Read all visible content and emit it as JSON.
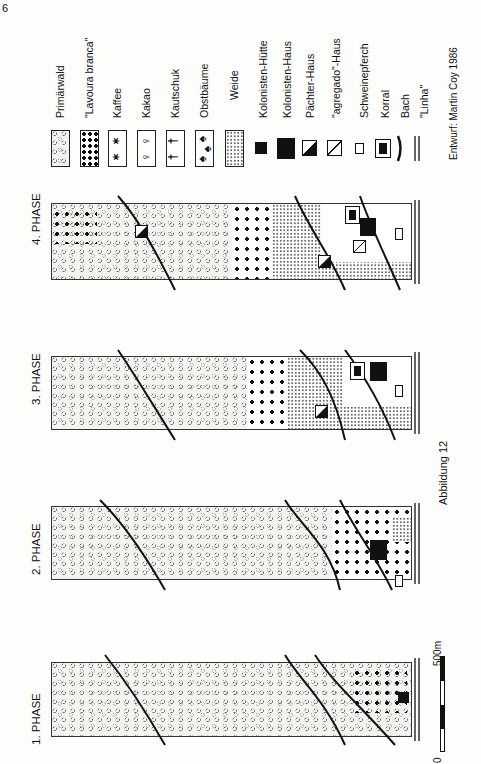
{
  "page": {
    "number": "6"
  },
  "legend": {
    "items": [
      {
        "key": "primarwald",
        "label": "Primärwald"
      },
      {
        "key": "lavoura",
        "label": "\"Lavoura branca\""
      },
      {
        "key": "kaffee",
        "label": "Kaffee"
      },
      {
        "key": "kakao",
        "label": "Kakao"
      },
      {
        "key": "kautschuk",
        "label": "Kautschuk"
      },
      {
        "key": "obstbaume",
        "label": "Obstbäume"
      },
      {
        "key": "weide",
        "label": "Weide"
      },
      {
        "key": "kolonisten_hutte",
        "label": "Kolonisten-Hütte"
      },
      {
        "key": "kolonisten_haus",
        "label": "Kolonisten-Haus"
      },
      {
        "key": "pachter_haus",
        "label": "Pächter-Haus"
      },
      {
        "key": "agregado_haus",
        "label": "\"agregado\"-Haus"
      },
      {
        "key": "schweinepferch",
        "label": "Schweinepferch"
      },
      {
        "key": "korral",
        "label": "Korral"
      },
      {
        "key": "bach",
        "label": "Bach"
      },
      {
        "key": "linha",
        "label": "\"Linha\""
      }
    ]
  },
  "credit": "Entwurf: Martin Coy 1986",
  "caption": "Abbildung 12",
  "phases": [
    {
      "label": "1. PHASE"
    },
    {
      "label": "2. PHASE"
    },
    {
      "label": "3. PHASE"
    },
    {
      "label": "4. PHASE"
    }
  ],
  "scale": {
    "zero": "0",
    "max": "500m"
  }
}
